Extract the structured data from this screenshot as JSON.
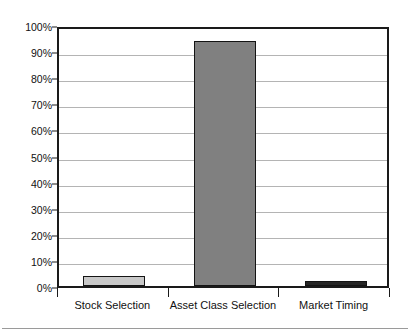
{
  "chart_data": {
    "type": "bar",
    "title": "",
    "subtitle": "",
    "xlabel": "",
    "ylabel": "",
    "categories": [
      "Stock Selection",
      "Asset Class Selection",
      "Market Timing"
    ],
    "values": [
      4,
      94,
      2
    ],
    "value_labels": [
      "4%",
      "94%",
      "2%"
    ],
    "ylim": [
      0,
      100
    ],
    "ytick_labels": [
      "0%",
      "10%",
      "20%",
      "30%",
      "40%",
      "50%",
      "60%",
      "70%",
      "80%",
      "90%",
      "100%"
    ],
    "ytick_values": [
      0,
      10,
      20,
      30,
      40,
      50,
      60,
      70,
      80,
      90,
      100
    ],
    "grid": true,
    "legend": false,
    "legend_position": "none",
    "annotations": [],
    "series": [
      {
        "name": "Contribution to Return Variation",
        "values": [
          4,
          94,
          2
        ]
      }
    ],
    "bar_colors": [
      "#c8c8c8",
      "#808080",
      "#262626"
    ],
    "bar_border_color": "#141414",
    "gridline_color": "#b4b4b4",
    "axis_color": "#1a1a1a",
    "background_color": "#ffffff",
    "text_color": "#111111"
  }
}
